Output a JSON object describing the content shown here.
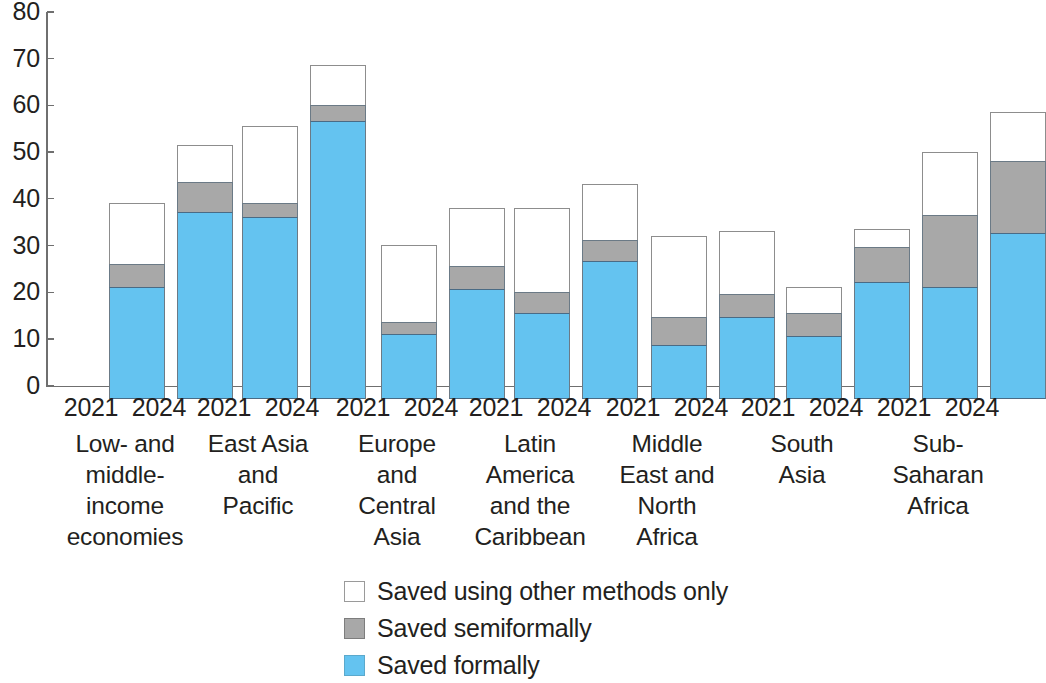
{
  "chart_data": {
    "type": "bar",
    "subtype": "stacked-grouped-column",
    "title": "",
    "subtitle": "",
    "xlabel": "",
    "ylabel": "",
    "ylim": [
      0,
      80
    ],
    "y_ticks": [
      0,
      10,
      20,
      30,
      40,
      50,
      60,
      70,
      80
    ],
    "grid": false,
    "legend_position": "bottom-center",
    "categories": [
      "Low- and middle-income economies",
      "East Asia and Pacific",
      "Europe and Central Asia",
      "Latin America and the Caribbean",
      "Middle East and North Africa",
      "South Asia",
      "Sub-Saharan Africa"
    ],
    "category_label_lines": [
      [
        "Low- and",
        "middle-",
        "income",
        "economies"
      ],
      [
        "East Asia",
        "and",
        "Pacific"
      ],
      [
        "Europe",
        "and",
        "Central",
        "Asia"
      ],
      [
        "Latin",
        "America",
        "and the",
        "Caribbean"
      ],
      [
        "Middle",
        "East and",
        "North",
        "Africa"
      ],
      [
        "South",
        "Asia"
      ],
      [
        "Sub-",
        "Saharan",
        "Africa"
      ]
    ],
    "years": [
      "2021",
      "2024"
    ],
    "series": [
      {
        "name": "Saved formally",
        "color": "#64c3f0",
        "values_2021": [
          24,
          39,
          14,
          18.5,
          11.5,
          13.5,
          24
        ],
        "values_2024": [
          40,
          59.5,
          23.5,
          29.5,
          17.5,
          25,
          35.5
        ]
      },
      {
        "name": "Saved semiformally",
        "color": "#a8a8a8",
        "values_2021": [
          5,
          3,
          2.5,
          4.5,
          6,
          5,
          15.5
        ],
        "values_2024": [
          6.5,
          3.5,
          5,
          4.5,
          5,
          7.5,
          15.5
        ]
      },
      {
        "name": "Saved using other methods only",
        "color": "#ffffff",
        "values_2021": [
          13,
          16.5,
          16.5,
          18,
          17.5,
          5.5,
          13.5
        ],
        "values_2024": [
          8,
          8.5,
          12.5,
          12,
          13.5,
          4,
          10.5
        ]
      }
    ],
    "totals_2021": [
      42,
      58.5,
      33,
      41,
      35,
      24,
      53
    ],
    "totals_2024": [
      54.5,
      71.5,
      41,
      46,
      36,
      36.5,
      61.5
    ]
  },
  "legend": {
    "items": [
      {
        "label": "Saved using other methods only",
        "swatch": "white-square-icon"
      },
      {
        "label": "Saved semiformally",
        "swatch": "gray-square-icon"
      },
      {
        "label": "Saved formally",
        "swatch": "blue-square-icon"
      }
    ]
  }
}
